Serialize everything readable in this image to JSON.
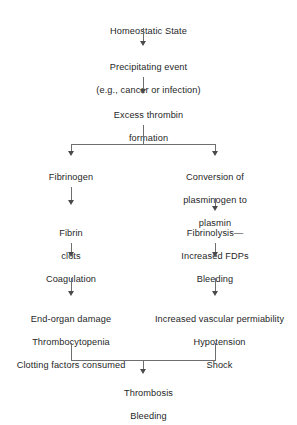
{
  "diagram": {
    "background_color": "#ffffff",
    "line_color": "#6e6e6e",
    "text_color": "#1f1f1f",
    "nodes": {
      "homeostatic_state": "Homeostatic State",
      "precipitating_event_line1": "Precipitating event",
      "precipitating_event_line2": "(e.g., cancer or infection)",
      "excess_thrombin_line1": "Excess thrombin",
      "excess_thrombin_line2": "formation",
      "fibrinogen": "Fibrinogen",
      "conversion_line1": "Conversion of",
      "conversion_line2": "plasminogen to",
      "conversion_line3": "plasmin",
      "fibrin_clots_line1": "Fibrin",
      "fibrin_clots_line2": "clots",
      "fibrinolysis_line1": "Fibrinolysis—",
      "fibrinolysis_line2": "Increased FDPs",
      "coagulation": "Coagulation",
      "bleeding_right": "Bleeding",
      "left_outcomes_line1": "End-organ damage",
      "left_outcomes_line2": "Thrombocytopenia",
      "left_outcomes_line3": "Clotting factors consumed",
      "right_outcomes_line1": "Increased vascular permiability",
      "right_outcomes_line2": "Hypotension",
      "right_outcomes_line3": "Shock",
      "final_line1": "Thrombosis",
      "final_line2": "Bleeding"
    }
  }
}
